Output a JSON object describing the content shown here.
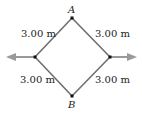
{
  "diagram": {
    "nodes": {
      "top": {
        "label": "A"
      },
      "bottom": {
        "label": "B"
      }
    },
    "edges": [
      {
        "id": "top-left",
        "label": "3.00 m"
      },
      {
        "id": "top-right",
        "label": "3.00 m"
      },
      {
        "id": "bottom-left",
        "label": "3.00 m"
      },
      {
        "id": "bottom-right",
        "label": "3.00 m"
      }
    ],
    "colors": {
      "edge": "#6f6f6f",
      "arrow": "#9a9a9a",
      "node": "#111111"
    }
  }
}
